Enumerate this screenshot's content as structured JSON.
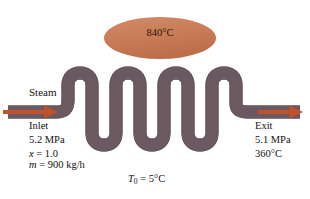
{
  "figure": {
    "source_temperature": {
      "label": "840°C",
      "shape": "ellipse",
      "fill_color": "#c97d58"
    },
    "surroundings": {
      "symbol": "T",
      "subscript": "0",
      "equals": " = ",
      "value": "5°C"
    },
    "inlet": {
      "flow_label": "Steam",
      "station_label": "Inlet",
      "pressure": "5.2 MPa",
      "quality_symbol": "x",
      "quality_equals": " = 1.0",
      "mass_flow_symbol": "m",
      "mass_flow_equals": " = 900 kg/h"
    },
    "exit": {
      "station_label": "Exit",
      "pressure": "5.1 MPa",
      "temperature": "360°C"
    },
    "pipe": {
      "outline_color": "#6b5a63",
      "fill_light": "#fbeee8",
      "fill_dark": "#f0b79a"
    },
    "arrows": {
      "color": "#c0512a",
      "inlet_name": "inlet-flow-arrow",
      "exit_name": "exit-flow-arrow"
    }
  }
}
